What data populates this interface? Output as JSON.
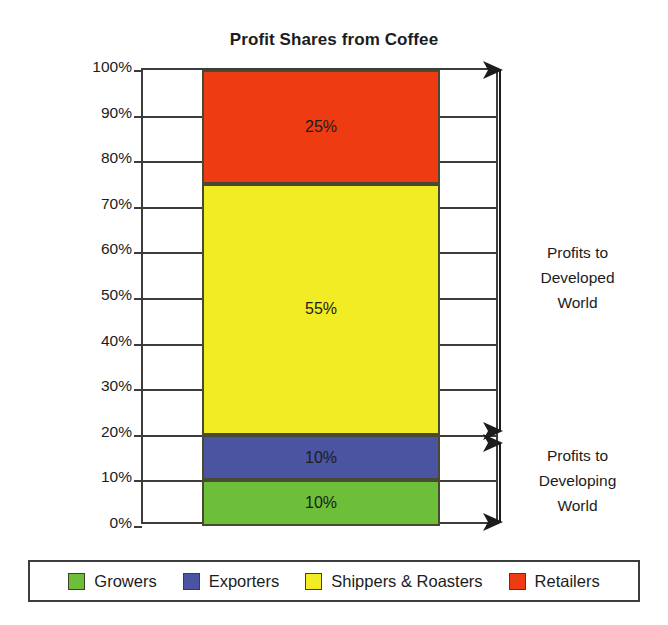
{
  "chart_data": {
    "type": "bar",
    "title": "Profit Shares from Coffee",
    "subtype": "stacked-bar-single-column",
    "xlabel": "",
    "ylabel": "Percentage Profit",
    "ylim": [
      0,
      100
    ],
    "ytick_labels": [
      "0%",
      "10%",
      "20%",
      "30%",
      "40%",
      "50%",
      "60%",
      "70%",
      "80%",
      "90%",
      "100%"
    ],
    "ytick_values": [
      0,
      10,
      20,
      30,
      40,
      50,
      60,
      70,
      80,
      90,
      100
    ],
    "grid": true,
    "legend_position": "bottom",
    "categories": [
      "Coffee"
    ],
    "series": [
      {
        "name": "Growers",
        "values": [
          10
        ],
        "label": "10%",
        "color": "#6DBE38",
        "start": 0,
        "end": 10
      },
      {
        "name": "Exporters",
        "values": [
          10
        ],
        "label": "10%",
        "color": "#4A54A0",
        "start": 10,
        "end": 20
      },
      {
        "name": "Shippers & Roasters",
        "values": [
          55
        ],
        "label": "55%",
        "color": "#F2EC25",
        "start": 20,
        "end": 75
      },
      {
        "name": "Retailers",
        "values": [
          25
        ],
        "label": "25%",
        "color": "#EE3B11",
        "start": 75,
        "end": 100
      }
    ],
    "annotations": [
      {
        "text": "Profits to\nDeveloped\nWorld",
        "line1": "Profits to",
        "line2": "Developed",
        "line3": "World",
        "range": [
          20,
          100
        ]
      },
      {
        "text": "Profits to\nDeveloping\nWorld",
        "line1": "Profits to",
        "line2": "Developing",
        "line3": "World",
        "range": [
          0,
          20
        ]
      }
    ]
  },
  "legend": {
    "items": [
      {
        "label": "Growers",
        "color": "#6DBE38"
      },
      {
        "label": "Exporters",
        "color": "#4A54A0"
      },
      {
        "label": "Shippers & Roasters",
        "color": "#F2EC25"
      },
      {
        "label": "Retailers",
        "color": "#EE3B11"
      }
    ]
  },
  "colors": {
    "axis": "#3c3c3c",
    "text": "#1c1c1c",
    "background": "#ffffff"
  }
}
